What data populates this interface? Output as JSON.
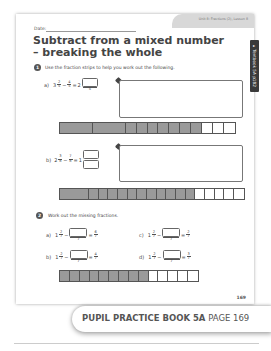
{
  "header": {
    "date_label": "Date:",
    "unit_lesson": "Unit 8: Fractions (2), Lesson 8",
    "side_tab": "▸ Textbook 5A p182"
  },
  "title": "Subtract from a mixed number – breaking the whole",
  "question1": {
    "number": "1",
    "instruction": "Use the fraction strips to help you work out the following.",
    "parts": [
      {
        "label": "a)",
        "whole": "3",
        "num": "2",
        "den": "5",
        "minus_num": "4",
        "minus_den": "5",
        "result_whole": "2",
        "result_den": "5",
        "strip": {
          "wholes_shaded": 2,
          "cells": 10,
          "shaded_cells": 7
        }
      },
      {
        "label": "b)",
        "whole": "2",
        "num": "3",
        "den": "8",
        "minus_num": "7",
        "minus_den": "8",
        "result_whole": "1",
        "strip": {
          "wholes_shaded": 1,
          "cells": 16,
          "shaded_cells": 11
        }
      }
    ]
  },
  "question2": {
    "number": "2",
    "instruction": "Work out the missing fractions.",
    "parts": [
      {
        "label": "a)",
        "whole": "1",
        "num": "2",
        "den": "7",
        "box_den": "7",
        "res_num": "6",
        "res_den": "7"
      },
      {
        "label": "b)",
        "whole": "1",
        "num": "2",
        "den": "7",
        "box_den": "7",
        "res_num": "4",
        "res_den": "7"
      },
      {
        "label": "c)",
        "whole": "1",
        "num": "2",
        "den": "7",
        "box_den": "7",
        "res_num": "2",
        "res_den": "7"
      },
      {
        "label": "d)",
        "whole": "1",
        "num": "2",
        "den": "7",
        "box_den": "7",
        "res_num": "3",
        "res_den": "7"
      }
    ],
    "strip": {
      "cells": 14,
      "shaded_cells": 9
    }
  },
  "page_number": "169",
  "banner": {
    "book": "PUPIL PRACTICE BOOK 5A",
    "page": "PAGE 169"
  },
  "colors": {
    "shaded": "#9a9a9a",
    "unshaded": "#ffffff",
    "tab": "#3a3a3a"
  }
}
